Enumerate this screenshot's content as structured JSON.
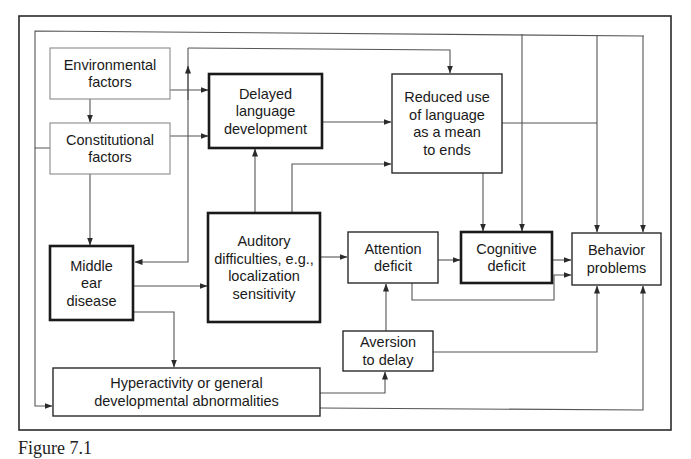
{
  "diagram": {
    "nodes": [
      {
        "id": "environmental",
        "lines": [
          "Environmental",
          "factors"
        ],
        "emphasis": "thin"
      },
      {
        "id": "constitutional",
        "lines": [
          "Constitutional",
          "factors"
        ],
        "emphasis": "thin"
      },
      {
        "id": "delayed_language",
        "lines": [
          "Delayed",
          "language",
          "development"
        ],
        "emphasis": "bold"
      },
      {
        "id": "reduced_use",
        "lines": [
          "Reduced use",
          "of language",
          "as a mean",
          "to ends"
        ],
        "emphasis": "normal"
      },
      {
        "id": "middle_ear",
        "lines": [
          "Middle",
          "ear",
          "disease"
        ],
        "emphasis": "bold"
      },
      {
        "id": "auditory",
        "lines": [
          "Auditory",
          "difficulties, e.g.,",
          "localization",
          "sensitivity"
        ],
        "emphasis": "bold"
      },
      {
        "id": "attention",
        "lines": [
          "Attention",
          "deficit"
        ],
        "emphasis": "normal"
      },
      {
        "id": "cognitive",
        "lines": [
          "Cognitive",
          "deficit"
        ],
        "emphasis": "bold"
      },
      {
        "id": "behavior",
        "lines": [
          "Behavior",
          "problems"
        ],
        "emphasis": "normal"
      },
      {
        "id": "aversion",
        "lines": [
          "Aversion",
          "to delay"
        ],
        "emphasis": "normal"
      },
      {
        "id": "hyperactivity",
        "lines": [
          "Hyperactivity or general",
          "developmental abnormalities"
        ],
        "emphasis": "normal"
      }
    ],
    "edges": [
      {
        "from": "environmental",
        "to": "constitutional"
      },
      {
        "from": "environmental",
        "to": "delayed_language"
      },
      {
        "from": "constitutional",
        "to": "delayed_language"
      },
      {
        "from": "constitutional",
        "to": "middle_ear"
      },
      {
        "from": "constitutional",
        "to": "hyperactivity"
      },
      {
        "from": "delayed_language",
        "to": "reduced_use"
      },
      {
        "from": "auditory",
        "to": "delayed_language"
      },
      {
        "from": "auditory",
        "to": "reduced_use"
      },
      {
        "from": "auditory",
        "to": "attention"
      },
      {
        "from": "auditory",
        "to": "middle_ear"
      },
      {
        "from": "auditory",
        "to": "reduced_use",
        "via": "top"
      },
      {
        "from": "middle_ear",
        "to": "auditory"
      },
      {
        "from": "middle_ear",
        "to": "hyperactivity"
      },
      {
        "from": "reduced_use",
        "to": "cognitive"
      },
      {
        "from": "reduced_use",
        "to": "behavior"
      },
      {
        "from": "attention",
        "to": "cognitive"
      },
      {
        "from": "attention",
        "to": "behavior"
      },
      {
        "from": "cognitive",
        "to": "behavior"
      },
      {
        "from": "aversion",
        "to": "attention"
      },
      {
        "from": "aversion",
        "to": "behavior"
      },
      {
        "from": "hyperactivity",
        "to": "aversion"
      },
      {
        "from": "hyperactivity",
        "to": "behavior"
      },
      {
        "from": "environmental",
        "to": "cognitive",
        "via": "top"
      },
      {
        "from": "environmental",
        "to": "behavior",
        "via": "top"
      }
    ],
    "colors": {
      "line": "#3a3a3a",
      "thin_border": "#8a8a8a",
      "frame": "#2a2a2a"
    }
  },
  "caption": "Figure 7.1"
}
